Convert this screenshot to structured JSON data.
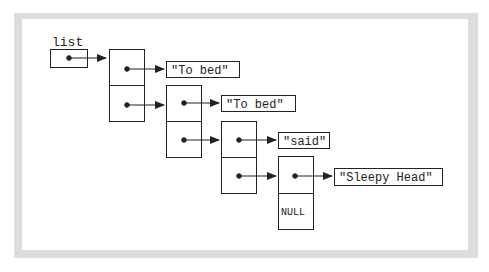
{
  "diagram": {
    "pointer_label": "list",
    "null_label": "NULL",
    "strings": [
      "\"To bed\"",
      "\"To bed\"",
      "\"said\"",
      "\"Sleepy Head\""
    ],
    "node_count": 4,
    "colors": {
      "line": "#222222",
      "frame": "#dcdcdc",
      "background": "#ffffff"
    }
  }
}
